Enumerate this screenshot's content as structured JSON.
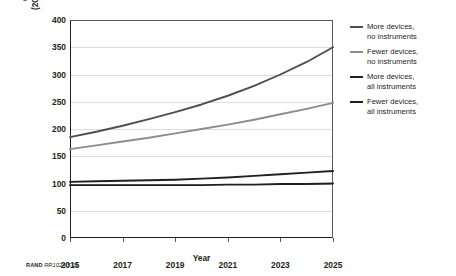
{
  "figure": {
    "credit_prefix": "RAND",
    "credit_id": "RR1024-5.11"
  },
  "chart_data": {
    "type": "line",
    "title": "",
    "subtitle": "",
    "xlabel": "Year",
    "ylabel": "Costs over time, by percentage (2015 losses to cyberattack = 100%)",
    "ylabel_line1": "Costs over time, by percentage",
    "ylabel_line2": "(2015 losses to cyberattack = 100%)",
    "x": [
      2015,
      2016,
      2017,
      2018,
      2019,
      2020,
      2021,
      2022,
      2023,
      2024,
      2025
    ],
    "xlim": [
      2015,
      2025
    ],
    "ylim": [
      0,
      400
    ],
    "xticks": [
      2015,
      2017,
      2019,
      2021,
      2023,
      2025
    ],
    "xtick_labels": [
      "2015",
      "2017",
      "2019",
      "2021",
      "2023",
      "2025"
    ],
    "yticks": [
      0,
      50,
      100,
      150,
      200,
      250,
      300,
      350,
      400
    ],
    "ytick_labels": [
      "0",
      "50",
      "100",
      "150",
      "200",
      "250",
      "300",
      "350",
      "400"
    ],
    "grid": "horizontal",
    "legend_position": "right",
    "series": [
      {
        "name": "More devices, no instruments",
        "color": "#4f4f52",
        "width": 1.9,
        "values": [
          185,
          195,
          206,
          218,
          231,
          245,
          261,
          279,
          300,
          323,
          350
        ]
      },
      {
        "name": "Fewer devices, no instruments",
        "color": "#8b8d90",
        "width": 1.9,
        "values": [
          163,
          170,
          177,
          184,
          192,
          200,
          208,
          217,
          227,
          237,
          248
        ]
      },
      {
        "name": "More devices, all instruments",
        "color": "#231f20",
        "width": 1.9,
        "values": [
          103,
          104,
          105,
          106,
          107,
          109,
          111,
          114,
          117,
          120,
          123
        ]
      },
      {
        "name": "Fewer devices, all instruments",
        "color": "#231f20",
        "width": 1.9,
        "values": [
          97,
          97,
          97,
          97,
          97,
          97,
          98,
          98,
          99,
          99,
          100
        ]
      }
    ]
  },
  "legend": {
    "items": [
      {
        "label_line1": "More devices,",
        "label_line2": "no instruments"
      },
      {
        "label_line1": "Fewer devices,",
        "label_line2": "no instruments"
      },
      {
        "label_line1": "More devices,",
        "label_line2": "all instruments"
      },
      {
        "label_line1": "Fewer devices,",
        "label_line2": "all instruments"
      }
    ]
  }
}
